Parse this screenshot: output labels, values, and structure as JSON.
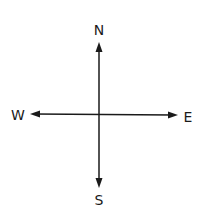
{
  "diagram": {
    "labels": {
      "north": "N",
      "south": "S",
      "east": "E",
      "west": "W"
    },
    "colors": {
      "line": "#1a1a1a",
      "text": "#1a1a1a",
      "background": "#ffffff"
    }
  }
}
